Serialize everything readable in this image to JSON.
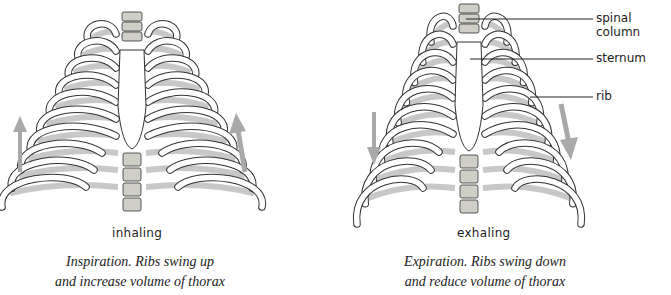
{
  "diagram": {
    "colors": {
      "bone_outline": "#333333",
      "bone_fill": "#ffffff",
      "cartilage_shade": "#c8c8c8",
      "vertebra_fill": "#cfcfc8",
      "arrow": "#a9a9a9",
      "text": "#222222"
    },
    "panels": [
      {
        "id": "inhalation",
        "state_label": "inhaling",
        "caption_line1": "Inspiration. Ribs swing up",
        "caption_line2": "and increase volume of thorax",
        "arrow_direction": "up",
        "arrow_icons": [
          "arrow-up-icon",
          "arrow-up-icon"
        ]
      },
      {
        "id": "exhalation",
        "state_label": "exhaling",
        "caption_line1": "Expiration. Ribs swing down",
        "caption_line2": "and reduce volume of thorax",
        "arrow_direction": "down",
        "arrow_icons": [
          "arrow-down-icon",
          "arrow-down-icon"
        ]
      }
    ],
    "callouts": [
      {
        "label": "spinal column"
      },
      {
        "label": "sternum"
      },
      {
        "label": "rib"
      }
    ]
  }
}
